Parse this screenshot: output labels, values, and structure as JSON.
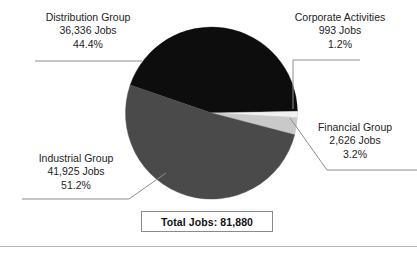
{
  "chart_data": {
    "type": "pie",
    "title": "",
    "categories": [
      "Distribution Group",
      "Industrial Group",
      "Financial Group",
      "Corporate Activities"
    ],
    "values": [
      36336,
      41925,
      2626,
      993
    ],
    "percentages": [
      44.4,
      51.2,
      3.2,
      1.2
    ],
    "value_unit": "Jobs",
    "total": 81880,
    "total_label": "Total Jobs: 81,880",
    "legend": "none",
    "grid": false,
    "slice_colors": [
      "#0d0d0d",
      "#4a4a4a",
      "#c9c9c9",
      "#f2f2f2"
    ],
    "slice_order_clockwise": [
      "Distribution Group",
      "Corporate Activities",
      "Financial Group",
      "Industrial Group"
    ],
    "start_angle_deg": -161,
    "slices": [
      {
        "name": "Distribution Group",
        "value": 36336,
        "percent": 44.4,
        "color": "#0d0d0d",
        "label_name": "Distribution Group",
        "label_value": "36,336 Jobs",
        "label_percent": "44.4%"
      },
      {
        "name": "Corporate Activities",
        "value": 993,
        "percent": 1.2,
        "color": "#f2f2f2",
        "label_name": "Corporate Activities",
        "label_value": "993 Jobs",
        "label_percent": "1.2%"
      },
      {
        "name": "Financial Group",
        "value": 2626,
        "percent": 3.2,
        "color": "#c9c9c9",
        "label_name": "Financial Group",
        "label_value": "2,626 Jobs",
        "label_percent": "3.2%"
      },
      {
        "name": "Industrial Group",
        "value": 41925,
        "percent": 51.2,
        "color": "#4a4a4a",
        "label_name": "Industrial Group",
        "label_value": "41,925 Jobs",
        "label_percent": "51.2%"
      }
    ]
  },
  "labels": {
    "distribution": {
      "name": "Distribution Group",
      "jobs": "36,336 Jobs",
      "percent": "44.4%"
    },
    "corporate": {
      "name": "Corporate Activities",
      "jobs": "993 Jobs",
      "percent": "1.2%"
    },
    "financial": {
      "name": "Financial Group",
      "jobs": "2,626 Jobs",
      "percent": "3.2%"
    },
    "industrial": {
      "name": "Industrial Group",
      "jobs": "41,925 Jobs",
      "percent": "51.2%"
    }
  },
  "total": {
    "text": "Total Jobs: 81,880"
  },
  "colors": {
    "distribution": "#0d0d0d",
    "industrial": "#4a4a4a",
    "financial": "#c9c9c9",
    "corporate": "#f2f2f2",
    "leader_line": "#8d8d8d",
    "box_border": "#8a8a8a",
    "rule": "#b9b9b9",
    "text": "#1d1d1d",
    "background": "#ffffff"
  }
}
